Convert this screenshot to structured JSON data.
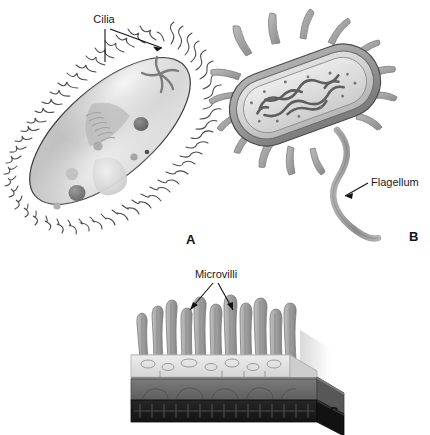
{
  "figure": {
    "background_color": "#ffffff",
    "label_color": "#1a1a1a"
  },
  "panels": [
    {
      "id": "A",
      "letter": "A",
      "subject": "ciliated protozoan",
      "callout": {
        "text": "Cilia",
        "name": "cilia-callout"
      },
      "structures": [
        "cilia",
        "pellicle",
        "oral groove",
        "contractile vacuole",
        "macronucleus",
        "food vacuole"
      ],
      "colors": {
        "body_light": "#d8d8d8",
        "body_mid": "#b6b6b6",
        "body_dark": "#9a9a9a",
        "outline": "#3a3a3a",
        "organelle_dark": "#6f6f6f"
      }
    },
    {
      "id": "B",
      "letter": "B",
      "subject": "flagellated bacterium with pili",
      "callout": {
        "text": "Flagellum",
        "name": "flagellum-callout"
      },
      "structures": [
        "pili",
        "cell wall",
        "plasma membrane",
        "cytoplasm",
        "nucleoid",
        "flagellum"
      ],
      "colors": {
        "wall_outer": "#9e9e9e",
        "wall_inner": "#c4c4c4",
        "cytoplasm": "#dcdcdc",
        "nucleoid": "#6a6a6a",
        "pili": "#a8a8a8",
        "flagellum": "#9c9c9c",
        "outline": "#4a4a4a"
      }
    },
    {
      "id": "C",
      "letter": "C",
      "subject": "epithelial cell surface with microvilli",
      "callout": {
        "text": "Microvilli",
        "name": "microvilli-callout"
      },
      "structures": [
        "microvilli",
        "terminal web",
        "apical cytoplasm",
        "middle tissue layer",
        "basal layer"
      ],
      "colors": {
        "microvilli": "#a6a6a6",
        "microvilli_shade": "#8d8d8d",
        "cytoplasm": "#e2e2e2",
        "layer_mid": "#6c6c6c",
        "layer_mid_side": "#575757",
        "layer_base": "#1e1e1e",
        "layer_base_side": "#121212",
        "outline": "#3a3a3a"
      }
    }
  ]
}
